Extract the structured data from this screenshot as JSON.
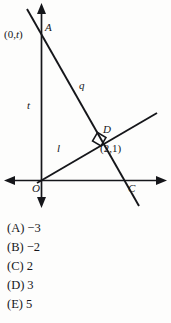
{
  "figure": {
    "type": "coordinate-geometry-diagram",
    "axes": {
      "x_axis_label": "",
      "y_axis_label": "",
      "origin_label": "O",
      "arrows": [
        "left",
        "right",
        "up",
        "down"
      ]
    },
    "points": [
      {
        "name": "A",
        "label": "A",
        "coord_label": "(0,t)",
        "on": "y-axis"
      },
      {
        "name": "D",
        "label": "D",
        "coord_label": "(2,1)",
        "on": "intersection"
      },
      {
        "name": "C",
        "label": "C",
        "coord_label": "",
        "on": "x-axis"
      },
      {
        "name": "O",
        "label": "O",
        "coord_label": "",
        "on": "origin"
      }
    ],
    "lines": [
      {
        "name": "q",
        "label": "q",
        "description": "steep negative-slope line through A and C"
      },
      {
        "name": "l",
        "label": "l",
        "description": "shallow positive-slope line through O and D"
      }
    ],
    "segment_labels": [
      {
        "name": "t",
        "label": "t",
        "description": "length from O to A on the y-axis"
      }
    ],
    "right_angle_at": "D"
  },
  "choices": [
    {
      "key": "(A)",
      "value": "−3"
    },
    {
      "key": "(B)",
      "value": "−2"
    },
    {
      "key": "(C)",
      "value": "2"
    },
    {
      "key": "(D)",
      "value": "3"
    },
    {
      "key": "(E)",
      "value": "5"
    }
  ]
}
